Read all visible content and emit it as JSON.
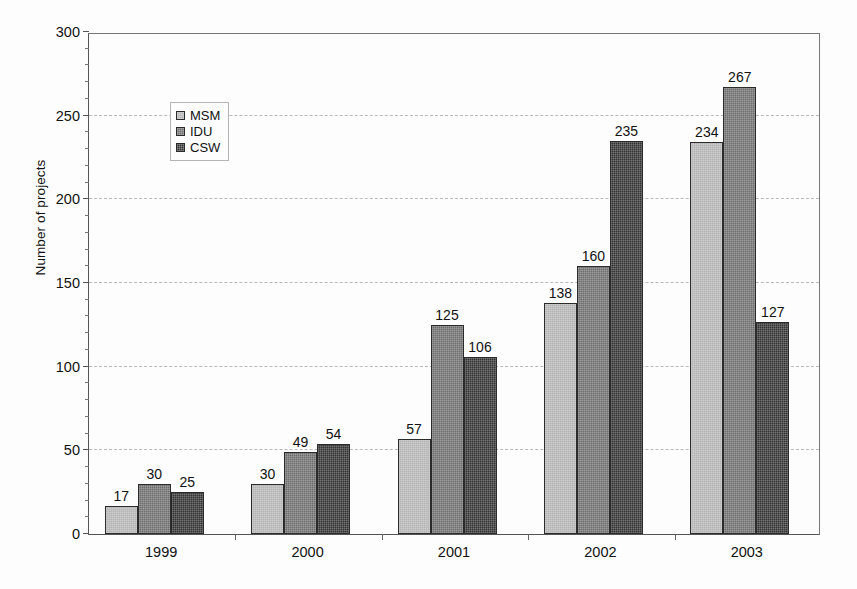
{
  "chart_data": {
    "type": "bar",
    "title": "",
    "xlabel": "",
    "ylabel": "Number of projects",
    "categories": [
      "1999",
      "2000",
      "2001",
      "2002",
      "2003"
    ],
    "series": [
      {
        "name": "MSM",
        "color": "#b4b4b4",
        "values": [
          17,
          30,
          57,
          138,
          234
        ]
      },
      {
        "name": "IDU",
        "color": "#6e6e6e",
        "values": [
          30,
          49,
          125,
          160,
          267
        ]
      },
      {
        "name": "CSW",
        "color": "#333333",
        "values": [
          25,
          54,
          106,
          235,
          127
        ]
      }
    ],
    "ylim": [
      0,
      300
    ],
    "yticks": [
      0,
      50,
      100,
      150,
      200,
      250,
      300
    ],
    "ytick_labels": [
      "0",
      "50",
      "100",
      "150",
      "200",
      "250",
      "300"
    ],
    "yminor_step": 10,
    "grid": "horizontal-dashed",
    "grid_color": "#b9b9b9",
    "legend_position": "upper-left-inside",
    "data_labels": true,
    "background": "#fdfdfd",
    "axis_color": "#555555"
  }
}
